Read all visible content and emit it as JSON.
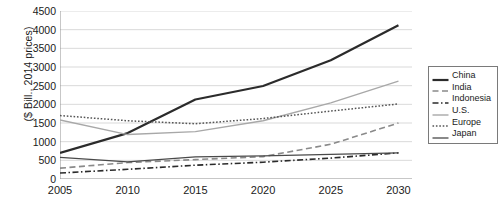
{
  "chart_data": {
    "type": "line",
    "title": "",
    "xlabel": "",
    "ylabel": "($ Bill., 2014 prices)",
    "xlim": [
      2005,
      2031
    ],
    "ylim": [
      0,
      4500
    ],
    "grid": true,
    "legend_position": "right",
    "x": [
      2005,
      2010,
      2015,
      2020,
      2025,
      2030
    ],
    "xticks": [
      "2005",
      "2010",
      "2015",
      "2020",
      "2025",
      "2030"
    ],
    "yticks": [
      "0",
      "500",
      "1000",
      "1500",
      "2000",
      "2500",
      "3000",
      "3500",
      "4000",
      "4500"
    ],
    "series": [
      {
        "name": "China",
        "style": "solid-thick",
        "color": "#2b2b2b",
        "values": [
          700,
          1230,
          2130,
          2490,
          3180,
          4120
        ]
      },
      {
        "name": "India",
        "style": "dashed",
        "color": "#8a8a8a",
        "values": [
          290,
          440,
          520,
          600,
          930,
          1500
        ]
      },
      {
        "name": "Indonesia",
        "style": "dash-dot",
        "color": "#2b2b2b",
        "values": [
          160,
          260,
          370,
          450,
          560,
          700
        ]
      },
      {
        "name": "U.S.",
        "style": "solid-thin-gray",
        "color": "#a8a8a8",
        "values": [
          1580,
          1190,
          1270,
          1560,
          2040,
          2620
        ]
      },
      {
        "name": "Europe",
        "style": "dotted",
        "color": "#555555",
        "values": [
          1700,
          1560,
          1480,
          1620,
          1820,
          2010
        ]
      },
      {
        "name": "Japan",
        "style": "solid-medium",
        "color": "#4a4a4a",
        "values": [
          580,
          460,
          590,
          620,
          660,
          700
        ]
      }
    ]
  },
  "legend": {
    "items": [
      {
        "label": "China"
      },
      {
        "label": "India"
      },
      {
        "label": "Indonesia"
      },
      {
        "label": "U.S."
      },
      {
        "label": "Europe"
      },
      {
        "label": "Japan"
      }
    ]
  }
}
